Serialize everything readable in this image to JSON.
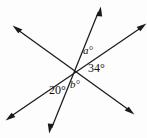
{
  "figure": {
    "background_color": "#fdfdfd",
    "stroke_color": "#1a1a1a",
    "vertex": {
      "x": 77,
      "y": 70
    },
    "lines": [
      {
        "name": "line-upper-left-to-lower-right",
        "from": {
          "x": 14,
          "y": 27
        },
        "to": {
          "x": 133,
          "y": 113
        },
        "double_headed": true
      },
      {
        "name": "line-upper-right-to-lower-left",
        "from": {
          "x": 145,
          "y": 25
        },
        "to": {
          "x": 7,
          "y": 119
        },
        "double_headed": true
      },
      {
        "name": "line-steep-top-to-bottom",
        "from": {
          "x": 100,
          "y": 8
        },
        "to": {
          "x": 50,
          "y": 132
        },
        "double_headed": true
      }
    ],
    "angle_labels": [
      {
        "id": "a",
        "text": "a°",
        "style": "italic",
        "x": 83,
        "y": 45
      },
      {
        "id": "34",
        "text": "34°",
        "style": "roman",
        "x": 88,
        "y": 62
      },
      {
        "id": "b",
        "text": "b°",
        "style": "italic",
        "x": 70,
        "y": 79
      },
      {
        "id": "20",
        "text": "20°",
        "style": "roman",
        "x": 49,
        "y": 84
      }
    ]
  }
}
